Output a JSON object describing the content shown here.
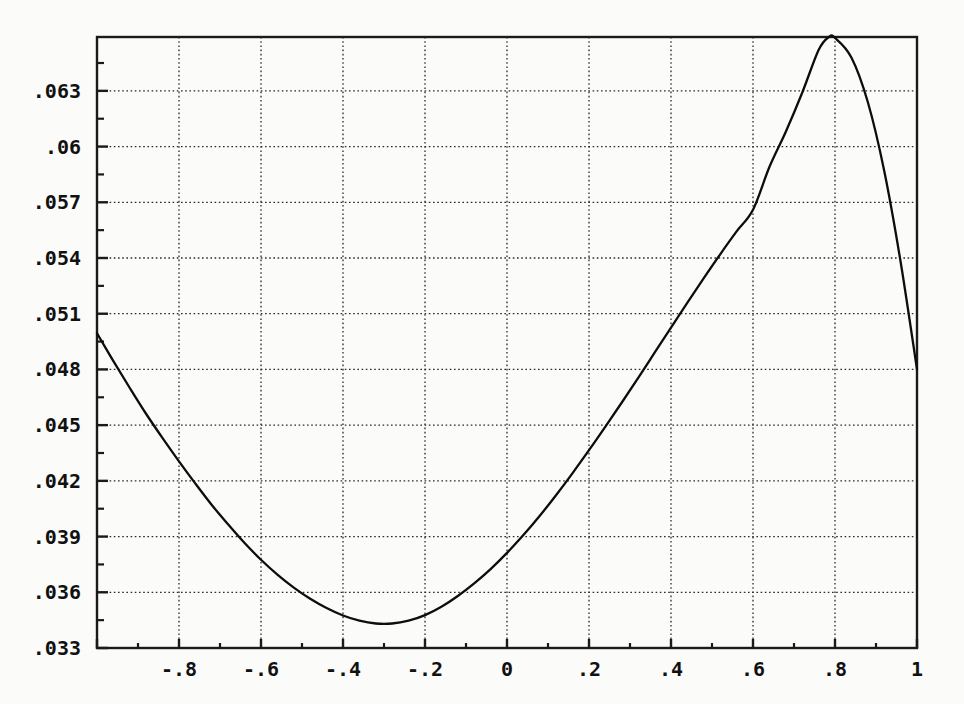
{
  "chart_data": {
    "type": "line",
    "title": "",
    "subtitle": "",
    "xlabel": "",
    "ylabel": "",
    "xlim": [
      -1,
      1
    ],
    "ylim": [
      0.033,
      0.0659
    ],
    "grid": true,
    "legend": null,
    "x_ticks": [
      -1,
      -0.8,
      -0.6,
      -0.4,
      -0.2,
      0,
      0.2,
      0.4,
      0.6,
      0.8,
      1
    ],
    "x_tick_labels": [
      "",
      "-.8",
      "-.6",
      "-.4",
      "-.2",
      "0",
      ".2",
      ".4",
      ".6",
      ".8",
      "1"
    ],
    "y_ticks": [
      0.033,
      0.036,
      0.039,
      0.042,
      0.045,
      0.048,
      0.051,
      0.054,
      0.057,
      0.06,
      0.063
    ],
    "y_tick_labels": [
      ".033",
      ".036",
      ".039",
      ".042",
      ".045",
      ".048",
      ".051",
      ".054",
      ".057",
      ".06",
      ".063"
    ],
    "x_minor_ticks": [
      -0.9,
      -0.7,
      -0.5,
      -0.3,
      -0.1,
      0.1,
      0.3,
      0.5,
      0.7,
      0.9
    ],
    "y_minor_ticks": [
      0.0345,
      0.0375,
      0.0405,
      0.0435,
      0.0465,
      0.0495,
      0.0525,
      0.0555,
      0.0585,
      0.0615,
      0.0645
    ],
    "line_color": "#0d0d0d",
    "grid_color": "#2a2a2a",
    "frame_color": "#1a1a1a",
    "series": [
      {
        "name": "curve",
        "x": [
          -1.0,
          -0.96,
          -0.92,
          -0.88,
          -0.84,
          -0.8,
          -0.76,
          -0.72,
          -0.68,
          -0.64,
          -0.6,
          -0.56,
          -0.52,
          -0.48,
          -0.44,
          -0.4,
          -0.36,
          -0.32,
          -0.28,
          -0.24,
          -0.2,
          -0.16,
          -0.12,
          -0.08,
          -0.04,
          0.0,
          0.04,
          0.08,
          0.12,
          0.16,
          0.2,
          0.24,
          0.28,
          0.32,
          0.36,
          0.4,
          0.44,
          0.48,
          0.52,
          0.56,
          0.6,
          0.64,
          0.68,
          0.72,
          0.76,
          0.785,
          0.8,
          0.84,
          0.88,
          0.92,
          0.96,
          1.0
        ],
        "y": [
          0.04995,
          0.04845,
          0.047,
          0.0456,
          0.0443,
          0.04305,
          0.04185,
          0.0407,
          0.03965,
          0.03865,
          0.03775,
          0.03695,
          0.03625,
          0.03565,
          0.03515,
          0.03475,
          0.03447,
          0.03432,
          0.03432,
          0.03447,
          0.03477,
          0.03522,
          0.0358,
          0.03648,
          0.03725,
          0.03812,
          0.03908,
          0.04012,
          0.04124,
          0.04242,
          0.04365,
          0.04492,
          0.04622,
          0.04755,
          0.0489,
          0.05025,
          0.0516,
          0.05292,
          0.0542,
          0.05543,
          0.0566,
          0.0589,
          0.0608,
          0.0629,
          0.0652,
          0.0659,
          0.06585,
          0.0648,
          0.0624,
          0.0587,
          0.0538,
          0.048
        ]
      }
    ],
    "annotations": {
      "minimum": {
        "x": -0.3,
        "y": 0.0343
      },
      "maximum": {
        "x": 0.785,
        "y": 0.0659
      },
      "left_endpoint": {
        "x": -1.0,
        "y": 0.05
      },
      "right_endpoint": {
        "x": 1.0,
        "y": 0.048
      }
    }
  },
  "plot_area": {
    "left_px": 97,
    "right_px": 917,
    "top_px": 37,
    "bottom_px": 648
  }
}
